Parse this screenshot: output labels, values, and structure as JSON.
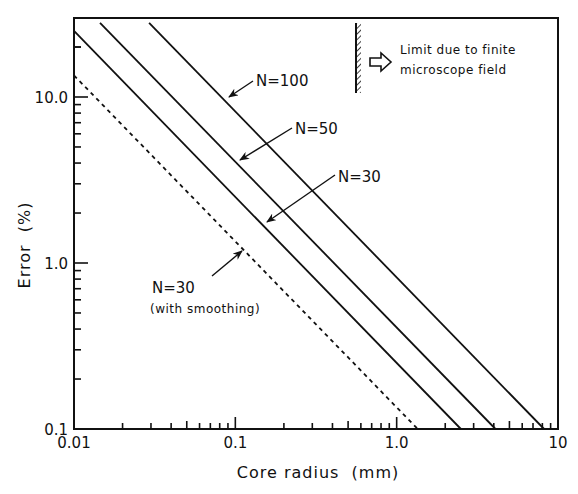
{
  "chart_data": {
    "type": "line",
    "title": "",
    "xlabel": "Core radius  (mm)",
    "ylabel": "Error  (%)",
    "xscale": "log",
    "yscale": "log",
    "xlim": [
      0.01,
      10
    ],
    "ylim": [
      0.1,
      30
    ],
    "grid": false,
    "x_ticks": [
      {
        "value": 0.01,
        "label": "0.01"
      },
      {
        "value": 0.1,
        "label": "0.1"
      },
      {
        "value": 1,
        "label": "1.0"
      },
      {
        "value": 10,
        "label": "10"
      }
    ],
    "y_ticks": [
      {
        "value": 0.1,
        "label": "0.1"
      },
      {
        "value": 1,
        "label": "1.0"
      },
      {
        "value": 10,
        "label": "10.0"
      }
    ],
    "series": [
      {
        "name": "N=100",
        "style": "solid",
        "relation": "Error = 0.82 / r",
        "x": [
          0.0292,
          8.2
        ],
        "y": [
          28,
          0.1
        ]
      },
      {
        "name": "N=50",
        "style": "solid",
        "relation": "Error = 0.41 / r",
        "x": [
          0.0145,
          4.1
        ],
        "y": [
          28,
          0.1
        ]
      },
      {
        "name": "N=30",
        "style": "solid",
        "relation": "Error = 0.25 / r",
        "x": [
          0.01,
          2.5
        ],
        "y": [
          25,
          0.1
        ]
      },
      {
        "name": "N=30 (with smoothing)",
        "style": "dashed",
        "relation": "Error = 0.135 / r",
        "x": [
          0.01,
          1.35
        ],
        "y": [
          13.5,
          0.1
        ]
      }
    ],
    "annotations": [
      {
        "text": "N=100",
        "arrow_to_series": "N=100"
      },
      {
        "text": "N=50",
        "arrow_to_series": "N=50"
      },
      {
        "text": "N=30",
        "arrow_to_series": "N=30"
      },
      {
        "text": "N=30",
        "subtext": "(with smoothing)",
        "arrow_to_series": "N=30 (with smoothing)"
      },
      {
        "text": "Limit due to finite",
        "text2": "microscope field",
        "marker": "hatched vertical wall with hollow arrow pointing right"
      }
    ]
  },
  "labels": {
    "xlabel": "Core radius  (mm)",
    "ylabel": "Error  (%)",
    "n100": "N=100",
    "n50": "N=50",
    "n30": "N=30",
    "n30s": "N=30",
    "n30s_sub": "(with smoothing)",
    "limit_line1": "Limit due to finite",
    "limit_line2": "microscope field"
  }
}
